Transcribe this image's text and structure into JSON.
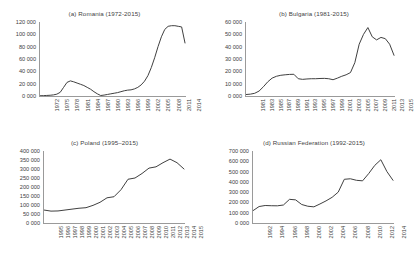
{
  "figure": {
    "background": "#ffffff",
    "line_color": "#404040",
    "axis_color": "#9a9a9a",
    "text_color": "#404040"
  },
  "chart_data": [
    {
      "type": "line",
      "title": "(a) Romania (1972-2015)",
      "xlabel": "",
      "ylabel": "",
      "grid": false,
      "legend": "none",
      "ylim": [
        0,
        120000
      ],
      "yticks": [
        0,
        20000,
        40000,
        60000,
        80000,
        100000,
        120000
      ],
      "ytick_labels": [
        "0 000",
        "20 000",
        "40 000",
        "60 000",
        "80 000",
        "100 000",
        "120 000"
      ],
      "xlim": [
        1972,
        2015
      ],
      "xticks": [
        1972,
        1975,
        1978,
        1981,
        1984,
        1987,
        1990,
        1993,
        1996,
        1999,
        2002,
        2005,
        2008,
        2011,
        2014
      ],
      "xtick_labels": [
        "1972",
        "1975",
        "1978",
        "1981",
        "1984",
        "1987",
        "1990",
        "1993",
        "1996",
        "1999",
        "2002",
        "2005",
        "2008",
        "2011",
        "2014"
      ],
      "x": [
        1972,
        1973,
        1974,
        1975,
        1976,
        1977,
        1978,
        1979,
        1980,
        1981,
        1982,
        1983,
        1984,
        1985,
        1986,
        1987,
        1988,
        1989,
        1990,
        1991,
        1992,
        1993,
        1994,
        1995,
        1996,
        1997,
        1998,
        1999,
        2000,
        2001,
        2002,
        2003,
        2004,
        2005,
        2006,
        2007,
        2008,
        2009,
        2010,
        2011,
        2012,
        2013,
        2014,
        2015
      ],
      "values": [
        400,
        600,
        900,
        1200,
        1800,
        3000,
        6000,
        14000,
        22000,
        24500,
        23000,
        21000,
        19000,
        17000,
        14000,
        11000,
        7000,
        3500,
        800,
        1500,
        2500,
        3500,
        4500,
        5500,
        7000,
        8500,
        9500,
        10000,
        11500,
        14000,
        18000,
        24000,
        33000,
        46000,
        62000,
        80000,
        96000,
        108000,
        113000,
        114000,
        114000,
        113000,
        112000,
        86000
      ]
    },
    {
      "type": "line",
      "title": "(b) Bulgaria (1981-2015)",
      "xlabel": "",
      "ylabel": "",
      "grid": false,
      "legend": "none",
      "ylim": [
        0,
        60000
      ],
      "yticks": [
        0,
        10000,
        20000,
        30000,
        40000,
        50000,
        60000
      ],
      "ytick_labels": [
        "0 000",
        "10 000",
        "20 000",
        "30 000",
        "40 000",
        "50 000",
        "60 000"
      ],
      "xlim": [
        1981,
        2015
      ],
      "xticks": [
        1981,
        1983,
        1985,
        1987,
        1989,
        1991,
        1993,
        1995,
        1997,
        1999,
        2001,
        2003,
        2005,
        2007,
        2009,
        2011,
        2013,
        2015
      ],
      "xtick_labels": [
        "1981",
        "1983",
        "1985",
        "1987",
        "1989",
        "1991",
        "1993",
        "1995",
        "1997",
        "1999",
        "2001",
        "2003",
        "2005",
        "2007",
        "2009",
        "2011",
        "2013",
        "2015"
      ],
      "x": [
        1981,
        1982,
        1983,
        1984,
        1985,
        1986,
        1987,
        1988,
        1989,
        1990,
        1991,
        1992,
        1993,
        1994,
        1995,
        1996,
        1997,
        1998,
        1999,
        2000,
        2001,
        2002,
        2003,
        2004,
        2005,
        2006,
        2007,
        2008,
        2009,
        2010,
        2011,
        2012,
        2013,
        2014,
        2015
      ],
      "values": [
        1200,
        1500,
        2200,
        4000,
        7500,
        11500,
        14500,
        16000,
        16800,
        17200,
        17500,
        17600,
        14000,
        13500,
        13800,
        14000,
        14000,
        14200,
        14300,
        14000,
        13200,
        14500,
        16000,
        17200,
        19000,
        27000,
        42000,
        50000,
        55500,
        48000,
        45500,
        47500,
        46500,
        42000,
        33000
      ]
    },
    {
      "type": "line",
      "title": "(c) Poland (1995–2015)",
      "xlabel": "",
      "ylabel": "",
      "grid": false,
      "legend": "none",
      "ylim": [
        0,
        400000
      ],
      "yticks": [
        0,
        50000,
        100000,
        150000,
        200000,
        250000,
        300000,
        350000,
        400000
      ],
      "ytick_labels": [
        "0 000",
        "50 000",
        "100 000",
        "150 000",
        "200 000",
        "250 000",
        "300 000",
        "350 000",
        "400 000"
      ],
      "xlim": [
        1995,
        2015
      ],
      "xticks": [
        1995,
        1996,
        1997,
        1998,
        1999,
        2000,
        2001,
        2002,
        2003,
        2004,
        2005,
        2006,
        2007,
        2008,
        2009,
        2010,
        2011,
        2012,
        2013,
        2014,
        2015
      ],
      "xtick_labels": [
        "1995",
        "1996",
        "1997",
        "1998",
        "1999",
        "2000",
        "2001",
        "2002",
        "2003",
        "2004",
        "2005",
        "2006",
        "2007",
        "2008",
        "2009",
        "2010",
        "2011",
        "2012",
        "2013",
        "2014",
        "2015"
      ],
      "x": [
        1995,
        1996,
        1997,
        1998,
        1999,
        2000,
        2001,
        2002,
        2003,
        2004,
        2005,
        2006,
        2007,
        2008,
        2009,
        2010,
        2011,
        2012,
        2013,
        2014,
        2015
      ],
      "values": [
        72000,
        66000,
        67000,
        72000,
        77000,
        82000,
        85000,
        98000,
        115000,
        140000,
        146000,
        185000,
        243000,
        250000,
        275000,
        305000,
        312000,
        335000,
        355000,
        335000,
        300000
      ]
    },
    {
      "type": "line",
      "title": "(d) Russian Federation (1992-2015)",
      "xlabel": "",
      "ylabel": "",
      "grid": false,
      "legend": "none",
      "ylim": [
        0,
        700000
      ],
      "yticks": [
        0,
        100000,
        200000,
        300000,
        400000,
        500000,
        600000,
        700000
      ],
      "ytick_labels": [
        "0 000",
        "100 000",
        "200 000",
        "300 000",
        "400 000",
        "500 000",
        "600 000",
        "700 000"
      ],
      "xlim": [
        1992,
        2015
      ],
      "xticks": [
        1992,
        1994,
        1996,
        1998,
        2000,
        2002,
        2004,
        2006,
        2008,
        2010,
        2012,
        2014
      ],
      "xtick_labels": [
        "1992",
        "1994",
        "1996",
        "1998",
        "2000",
        "2002",
        "2004",
        "2006",
        "2008",
        "2010",
        "2012",
        "2014"
      ],
      "x": [
        1992,
        1993,
        1994,
        1995,
        1996,
        1997,
        1998,
        1999,
        2000,
        2001,
        2002,
        2003,
        2004,
        2005,
        2006,
        2007,
        2008,
        2009,
        2010,
        2011,
        2012,
        2013,
        2014,
        2015
      ],
      "values": [
        120000,
        160000,
        170000,
        168000,
        167000,
        175000,
        230000,
        225000,
        180000,
        163000,
        157000,
        185000,
        215000,
        250000,
        300000,
        425000,
        430000,
        415000,
        410000,
        480000,
        560000,
        615000,
        500000,
        415000
      ]
    }
  ]
}
